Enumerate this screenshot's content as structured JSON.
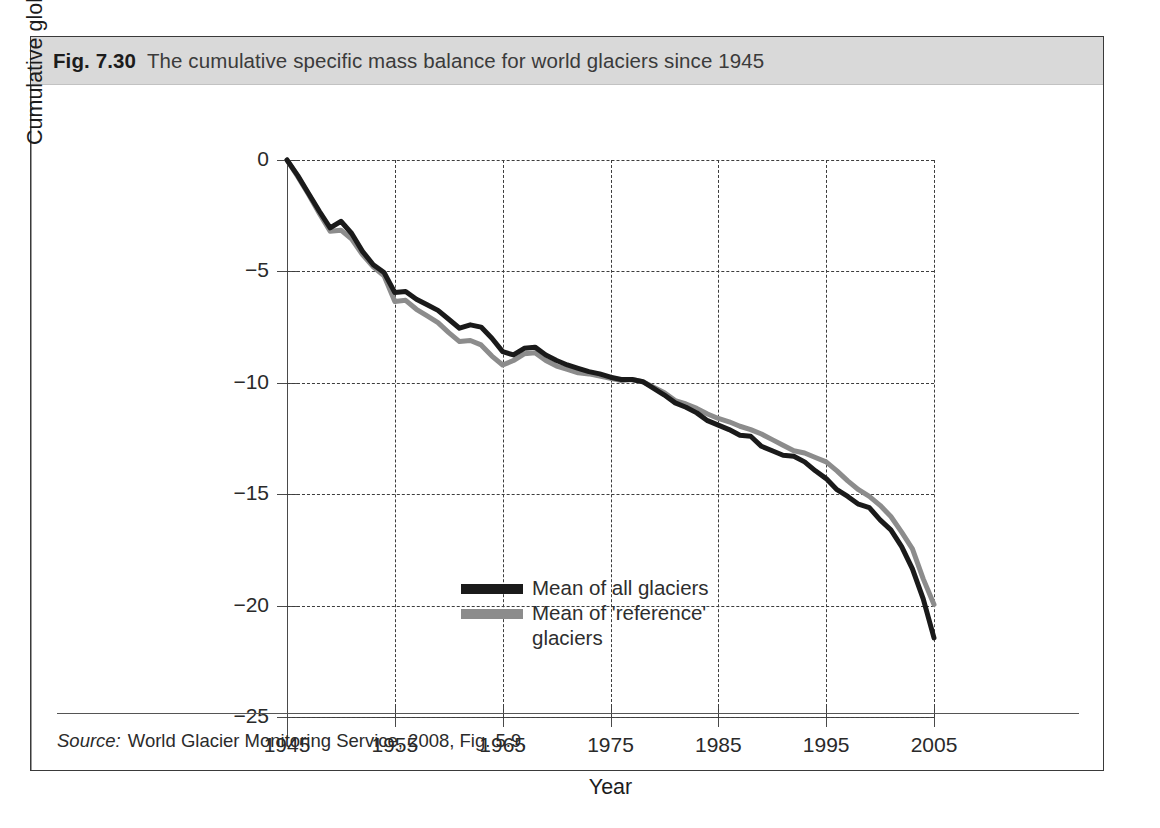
{
  "figure": {
    "number": "Fig. 7.30",
    "caption": "The cumulative specific mass balance for world glaciers since 1945",
    "source_label": "Source:",
    "source_text": "World Glacier Monitoring Service, 2008, Fig. 5.9."
  },
  "chart_data": {
    "type": "line",
    "title": "The cumulative specific mass balance for world glaciers since 1945",
    "xlabel": "Year",
    "ylabel": "Cumulative global mean specific mass balance (m w.e.)",
    "xlim": [
      1945,
      2005
    ],
    "ylim": [
      -25,
      0
    ],
    "xticks": [
      1945,
      1955,
      1965,
      1975,
      1985,
      1995,
      2005
    ],
    "xtick_labels": [
      "1945",
      "1955",
      "1965",
      "1975",
      "1985",
      "1995",
      "2005"
    ],
    "yticks": [
      0,
      -5,
      -10,
      -15,
      -20,
      -25
    ],
    "ytick_labels": [
      "0",
      "−5",
      "−10",
      "−15",
      "−20",
      "−25"
    ],
    "grid": true,
    "grid_style": "dashed",
    "legend_position": "center-left",
    "units": "m w.e.",
    "series": [
      {
        "name": "Mean of all glaciers",
        "color": "#1a1a1a",
        "x": [
          1945,
          1946,
          1947,
          1948,
          1949,
          1950,
          1951,
          1952,
          1953,
          1954,
          1955,
          1956,
          1957,
          1958,
          1959,
          1960,
          1961,
          1962,
          1963,
          1964,
          1965,
          1966,
          1967,
          1968,
          1969,
          1970,
          1971,
          1972,
          1973,
          1974,
          1975,
          1976,
          1977,
          1978,
          1979,
          1980,
          1981,
          1982,
          1983,
          1984,
          1985,
          1986,
          1987,
          1988,
          1989,
          1990,
          1991,
          1992,
          1993,
          1994,
          1995,
          1996,
          1997,
          1998,
          1999,
          2000,
          2001,
          2002,
          2003,
          2004,
          2005
        ],
        "y": [
          0.0,
          -0.7,
          -1.5,
          -2.3,
          -3.05,
          -2.75,
          -3.3,
          -4.1,
          -4.7,
          -5.05,
          -5.95,
          -5.9,
          -6.25,
          -6.5,
          -6.75,
          -7.15,
          -7.55,
          -7.4,
          -7.5,
          -8.0,
          -8.6,
          -8.75,
          -8.45,
          -8.4,
          -8.75,
          -9.0,
          -9.2,
          -9.35,
          -9.5,
          -9.6,
          -9.75,
          -9.85,
          -9.85,
          -9.95,
          -10.25,
          -10.55,
          -10.9,
          -11.1,
          -11.35,
          -11.7,
          -11.9,
          -12.1,
          -12.35,
          -12.4,
          -12.85,
          -13.05,
          -13.25,
          -13.3,
          -13.55,
          -13.95,
          -14.3,
          -14.8,
          -15.1,
          -15.45,
          -15.6,
          -16.15,
          -16.6,
          -17.35,
          -18.35,
          -19.7,
          -21.45
        ]
      },
      {
        "name": "Mean of 'reference' glaciers",
        "color": "#8c8c8c",
        "x": [
          1945,
          1946,
          1947,
          1948,
          1949,
          1950,
          1951,
          1952,
          1953,
          1954,
          1955,
          1956,
          1957,
          1958,
          1959,
          1960,
          1961,
          1962,
          1963,
          1964,
          1965,
          1966,
          1967,
          1968,
          1969,
          1970,
          1971,
          1972,
          1973,
          1974,
          1975,
          1976,
          1977,
          1978,
          1979,
          1980,
          1981,
          1982,
          1983,
          1984,
          1985,
          1986,
          1987,
          1988,
          1989,
          1990,
          1991,
          1992,
          1993,
          1994,
          1995,
          1996,
          1997,
          1998,
          1999,
          2000,
          2001,
          2002,
          2003,
          2004,
          2005
        ],
        "y": [
          0.0,
          -0.75,
          -1.55,
          -2.4,
          -3.2,
          -3.15,
          -3.55,
          -4.25,
          -4.8,
          -5.2,
          -6.35,
          -6.3,
          -6.7,
          -7.0,
          -7.3,
          -7.75,
          -8.15,
          -8.1,
          -8.3,
          -8.8,
          -9.2,
          -9.0,
          -8.7,
          -8.65,
          -9.0,
          -9.25,
          -9.4,
          -9.55,
          -9.6,
          -9.7,
          -9.8,
          -9.9,
          -9.85,
          -9.95,
          -10.2,
          -10.45,
          -10.8,
          -10.95,
          -11.15,
          -11.4,
          -11.6,
          -11.75,
          -11.95,
          -12.1,
          -12.3,
          -12.55,
          -12.8,
          -13.05,
          -13.15,
          -13.35,
          -13.55,
          -13.95,
          -14.4,
          -14.8,
          -15.1,
          -15.5,
          -16.0,
          -16.7,
          -17.45,
          -18.8,
          -19.95
        ]
      }
    ]
  },
  "legend": {
    "items": [
      {
        "label": "Mean of all glaciers",
        "color": "#1a1a1a"
      },
      {
        "label": "Mean of 'reference'\nglaciers",
        "color": "#8c8c8c"
      }
    ]
  }
}
